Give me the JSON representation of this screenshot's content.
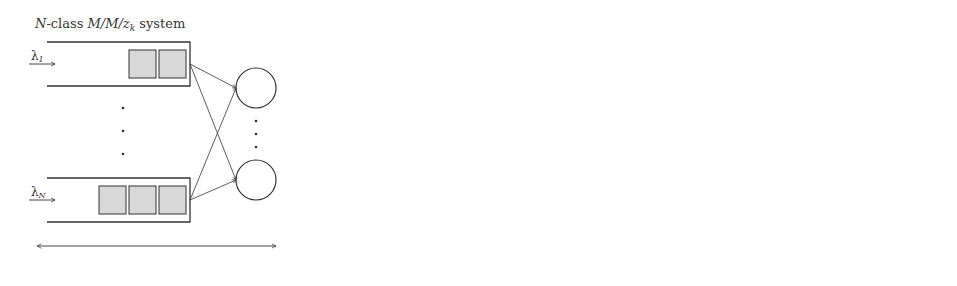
{
  "original": {
    "title_prefix": "N",
    "title_mid": "-class ",
    "title_math": "M/M/z",
    "title_sub": "k",
    "title_suffix": " system",
    "queues": [
      {
        "label": "λ",
        "sub": "1",
        "jobs": 2
      },
      {
        "label": "λ",
        "sub": "N",
        "jobs": 3
      }
    ],
    "caption": "Original System"
  },
  "arrow_symbol": "⇒",
  "decomposed": {
    "caption": "Decomposed Approximated System",
    "plus": "+",
    "ellipsis": "· · ·",
    "systems": [
      {
        "title_prefix": "3",
        "title_mid": "-class ",
        "title_math": "M/M/z",
        "title_sub": "k",
        "title_suffix": " system",
        "queues": [
          {
            "label": "λ",
            "sub": "1",
            "jobs": 2
          },
          {
            "label": "Λ",
            "sub": "A",
            "jobs": 1
          },
          {
            "label": "Λ",
            "sub": "A′",
            "jobs": 3
          }
        ]
      },
      {
        "title_prefix": "3",
        "title_mid": "-class ",
        "title_math": "M/M/z",
        "title_sub": "k",
        "title_suffix": " system",
        "queues": [
          {
            "label": "Λ",
            "sub": "A",
            "jobs": 2
          },
          {
            "label": "Λ",
            "sub": "A′",
            "jobs": 1
          },
          {
            "label": "λ",
            "sub": "N",
            "jobs": 3
          }
        ]
      }
    ]
  },
  "colors": {
    "line": "#333333",
    "job_fill": "#d9d9d9"
  }
}
